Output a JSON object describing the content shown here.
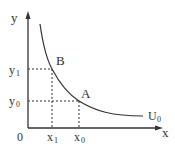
{
  "diagram": {
    "axes": {
      "x_label": "x",
      "y_label": "y",
      "origin_label": "0"
    },
    "curve": {
      "label_main": "U",
      "label_sub": "0"
    },
    "points": [
      {
        "name": "B",
        "x_label": "x",
        "x_sub": "1",
        "y_label": "y",
        "y_sub": "1"
      },
      {
        "name": "A",
        "x_label": "x",
        "x_sub": "0",
        "y_label": "y",
        "y_sub": "0"
      }
    ],
    "colors": {
      "line": "#333333",
      "background": "#ffffff"
    }
  }
}
